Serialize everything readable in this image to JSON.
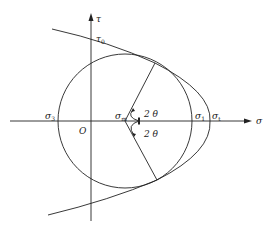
{
  "diagram": {
    "type": "mohr-circle-with-failure-envelope",
    "colors": {
      "line": "#222222",
      "background": "#ffffff"
    },
    "axes": {
      "horizontal_label": "σ",
      "vertical_label": "τ",
      "origin_label": "O"
    },
    "labels": {
      "tau0": {
        "main": "τ",
        "sub": "0"
      },
      "sigma3": {
        "main": "σ",
        "sub": "3"
      },
      "sigma_m": {
        "main": "σ",
        "sub": "m"
      },
      "sigma1_circle": {
        "main": "σ",
        "sub": "1"
      },
      "sigma1_envelope": {
        "main": "σ",
        "sub": "t"
      },
      "angle_upper": "2 θ",
      "angle_lower": "2 θ"
    }
  }
}
